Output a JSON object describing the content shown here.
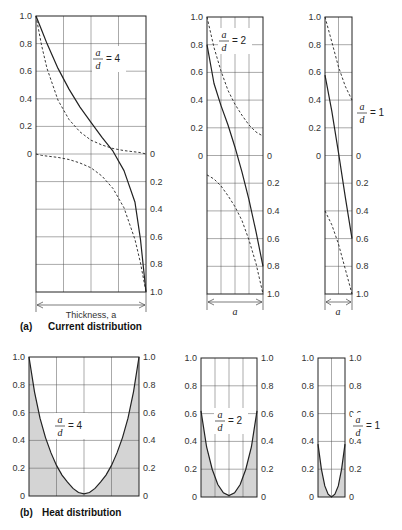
{
  "figure": {
    "panel_a_caption": {
      "letter": "(a)",
      "text": "Current distribution"
    },
    "panel_b_caption": {
      "letter": "(b)",
      "text": "Heat distribution"
    },
    "thickness_label": "Thickness, a",
    "width_label": "a"
  },
  "style": {
    "line": "#222222",
    "grid": "#555555",
    "fill": "#d4d4d4"
  },
  "chart_data": [
    {
      "panel": "a",
      "type": "line",
      "title": "Current distribution, a/d = 4",
      "ratio_label": {
        "num": "a",
        "den": "d",
        "value": "= 4"
      },
      "frame": {
        "x0": 36,
        "x1": 146,
        "y0": 16,
        "y1": 292
      },
      "xgrid": 4,
      "left_axis": {
        "ticks": [
          "1.0",
          "0.8",
          "0.6",
          "0.4",
          "0.2",
          "0"
        ],
        "range": [
          0,
          1.0
        ],
        "span": "top-half"
      },
      "right_axis": {
        "ticks": [
          "0",
          "0.2",
          "0.4",
          "0.6",
          "0.8",
          "1.0"
        ],
        "range": [
          0,
          1.0
        ],
        "span": "bottom-half",
        "inverted": true
      },
      "x": [
        0,
        0.05,
        0.1,
        0.2,
        0.3,
        0.4,
        0.5,
        0.6,
        0.7,
        0.8,
        0.9,
        0.95,
        1.0
      ],
      "series": [
        {
          "name": "real component (dashed, upper)",
          "dash": true,
          "half": "top",
          "values": [
            1.0,
            0.79,
            0.62,
            0.39,
            0.25,
            0.16,
            0.1,
            0.065,
            0.04,
            0.025,
            0.015,
            0.01,
            0.0
          ]
        },
        {
          "name": "resultant (solid)",
          "dash": false,
          "half": "full",
          "values": [
            1.0,
            0.9,
            0.8,
            0.62,
            0.47,
            0.34,
            0.23,
            0.12,
            0.02,
            -0.12,
            -0.35,
            -0.62,
            -1.0
          ]
        },
        {
          "name": "imag component (dashed, lower)",
          "dash": true,
          "half": "bottom",
          "values": [
            0.0,
            0.01,
            0.015,
            0.025,
            0.04,
            0.065,
            0.1,
            0.16,
            0.25,
            0.39,
            0.62,
            0.79,
            1.0
          ]
        }
      ]
    },
    {
      "panel": "a",
      "type": "line",
      "title": "Current distribution, a/d = 2",
      "ratio_label": {
        "num": "a",
        "den": "d",
        "value": "= 2"
      },
      "frame": {
        "x0": 207,
        "x1": 263,
        "y0": 17,
        "y1": 294
      },
      "xgrid": 4,
      "left_axis": {
        "ticks": [
          "1.0",
          "0.8",
          "0.6",
          "0.4",
          "0.2",
          "0"
        ],
        "range": [
          0,
          1.0
        ],
        "span": "top-half"
      },
      "right_axis": {
        "ticks": [
          "0",
          "0.2",
          "0.4",
          "0.6",
          "0.8",
          "1.0"
        ],
        "range": [
          0,
          1.0
        ],
        "span": "bottom-half",
        "inverted": true
      },
      "x": [
        0,
        0.125,
        0.25,
        0.375,
        0.5,
        0.625,
        0.75,
        0.875,
        1.0
      ],
      "series": [
        {
          "name": "real component (dashed, upper)",
          "dash": true,
          "half": "top",
          "values": [
            1.0,
            0.78,
            0.61,
            0.47,
            0.37,
            0.29,
            0.22,
            0.17,
            0.14
          ]
        },
        {
          "name": "resultant (solid)",
          "dash": false,
          "half": "full",
          "values": [
            0.8,
            0.52,
            0.36,
            0.22,
            0.06,
            -0.12,
            -0.32,
            -0.55,
            -0.8
          ]
        },
        {
          "name": "imag component (dashed, lower)",
          "dash": true,
          "half": "bottom",
          "values": [
            0.14,
            0.17,
            0.22,
            0.29,
            0.37,
            0.47,
            0.61,
            0.78,
            1.0
          ]
        }
      ]
    },
    {
      "panel": "a",
      "type": "line",
      "title": "Current distribution, a/d = 1",
      "ratio_label": {
        "num": "a",
        "den": "d",
        "value": "= 1"
      },
      "frame": {
        "x0": 325,
        "x1": 352,
        "y0": 17,
        "y1": 294
      },
      "xgrid": 2,
      "left_axis": {
        "ticks": [
          "1.0",
          "0.8",
          "0.6",
          "0.4",
          "0.2",
          "0"
        ],
        "range": [
          0,
          1.0
        ],
        "span": "top-half"
      },
      "right_axis": {
        "ticks": [
          "0",
          "0.2",
          "0.4",
          "0.6",
          "0.8",
          "1.0"
        ],
        "range": [
          0,
          1.0
        ],
        "span": "bottom-half",
        "inverted": true
      },
      "x": [
        0,
        0.25,
        0.5,
        0.75,
        1.0
      ],
      "series": [
        {
          "name": "real component (dashed, upper)",
          "dash": true,
          "half": "top",
          "values": [
            1.0,
            0.82,
            0.64,
            0.5,
            0.4
          ]
        },
        {
          "name": "resultant (solid)",
          "dash": false,
          "half": "full",
          "values": [
            0.58,
            0.32,
            0.02,
            -0.3,
            -0.6
          ]
        },
        {
          "name": "imag component (dashed, lower)",
          "dash": true,
          "half": "bottom",
          "values": [
            0.4,
            0.5,
            0.64,
            0.82,
            1.0
          ]
        }
      ]
    },
    {
      "panel": "b",
      "type": "area",
      "title": "Heat distribution, a/d = 4",
      "ratio_label": {
        "num": "a",
        "den": "d",
        "value": "= 4"
      },
      "frame": {
        "x0": 29,
        "x1": 139,
        "y0": 357,
        "y1": 496
      },
      "xgrid": 4,
      "ylim": [
        0,
        1.0
      ],
      "left_axis": {
        "ticks": [
          "1.0",
          "0.8",
          "0.6",
          "0.4",
          "0.2",
          "0"
        ]
      },
      "right_axis": {
        "ticks": [
          "1.0",
          "0.8",
          "0.6",
          "0.4",
          "0.2",
          "0"
        ]
      },
      "x": [
        0,
        0.05,
        0.1,
        0.15,
        0.2,
        0.25,
        0.3,
        0.35,
        0.4,
        0.45,
        0.5,
        0.55,
        0.6,
        0.65,
        0.7,
        0.75,
        0.8,
        0.85,
        0.9,
        0.95,
        1.0
      ],
      "values": [
        1.0,
        0.75,
        0.56,
        0.42,
        0.31,
        0.22,
        0.15,
        0.1,
        0.055,
        0.025,
        0.015,
        0.025,
        0.055,
        0.1,
        0.15,
        0.22,
        0.31,
        0.42,
        0.56,
        0.75,
        1.0
      ]
    },
    {
      "panel": "b",
      "type": "area",
      "title": "Heat distribution, a/d = 2",
      "ratio_label": {
        "num": "a",
        "den": "d",
        "value": "= 2"
      },
      "frame": {
        "x0": 201,
        "x1": 257,
        "y0": 358,
        "y1": 497
      },
      "xgrid": 4,
      "ylim": [
        0,
        1.0
      ],
      "left_axis": {
        "ticks": [
          "1.0",
          "0.8",
          "0.6",
          "0.4",
          "0.2",
          "0"
        ]
      },
      "right_axis": {
        "ticks": [
          "1.0",
          "0.8",
          "0.6",
          "0.4",
          "0.2",
          "0"
        ]
      },
      "x": [
        0,
        0.1,
        0.2,
        0.3,
        0.4,
        0.5,
        0.6,
        0.7,
        0.8,
        0.9,
        1.0
      ],
      "values": [
        0.62,
        0.36,
        0.2,
        0.09,
        0.03,
        0.01,
        0.03,
        0.09,
        0.2,
        0.36,
        0.62
      ]
    },
    {
      "panel": "b",
      "type": "area",
      "title": "Heat distribution, a/d = 1",
      "ratio_label": {
        "num": "a",
        "den": "d",
        "value": "= 1"
      },
      "frame": {
        "x0": 318,
        "x1": 345,
        "y0": 358,
        "y1": 497
      },
      "xgrid": 2,
      "ylim": [
        0,
        1.0
      ],
      "left_axis": {
        "ticks": [
          "1.0",
          "0.8",
          "0.6",
          "0.4",
          "0.2",
          "0"
        ]
      },
      "right_axis": {
        "ticks": [
          "1.0",
          "0.8",
          "0.6",
          "0.4",
          "0.2",
          "0"
        ]
      },
      "x": [
        0,
        0.125,
        0.25,
        0.375,
        0.5,
        0.625,
        0.75,
        0.875,
        1.0
      ],
      "values": [
        0.38,
        0.2,
        0.08,
        0.02,
        0.0,
        0.02,
        0.08,
        0.2,
        0.38
      ]
    }
  ]
}
